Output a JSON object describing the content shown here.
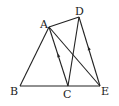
{
  "figure": {
    "type": "geometry",
    "points": [
      {
        "name": "A",
        "x": 49,
        "y": 27,
        "lx": 40,
        "ly": 27
      },
      {
        "name": "D",
        "x": 79,
        "y": 17,
        "lx": 75,
        "ly": 14
      },
      {
        "name": "B",
        "x": 20,
        "y": 86,
        "lx": 11,
        "ly": 94
      },
      {
        "name": "C",
        "x": 68,
        "y": 86,
        "lx": 63,
        "ly": 97
      },
      {
        "name": "E",
        "x": 100,
        "y": 86,
        "lx": 101,
        "ly": 94
      }
    ],
    "edges": [
      [
        "A",
        "B"
      ],
      [
        "A",
        "C"
      ],
      [
        "A",
        "D"
      ],
      [
        "A",
        "E"
      ],
      [
        "D",
        "C"
      ],
      [
        "D",
        "E"
      ],
      [
        "B",
        "E"
      ]
    ],
    "parallel_marks": [
      {
        "edge": [
          "C",
          "A"
        ],
        "x": 58.5,
        "y": 56
      },
      {
        "edge": [
          "E",
          "D"
        ],
        "x": 89,
        "y": 49
      }
    ],
    "labels": {
      "A": "A",
      "B": "B",
      "C": "C",
      "D": "D",
      "E": "E"
    }
  }
}
